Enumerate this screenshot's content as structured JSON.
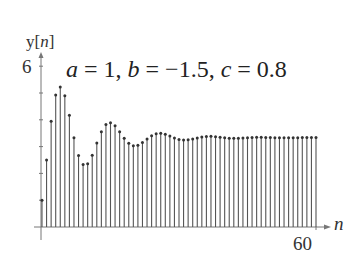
{
  "chart_data": {
    "type": "stem",
    "title_parts": {
      "a_label": "a",
      "a_value": "1",
      "b_label": "b",
      "b_value": "−1.5",
      "c_label": "c",
      "c_value": "0.8"
    },
    "xlabel": "n",
    "ylabel": "y[n]",
    "ylabel_parts": {
      "func": "y",
      "arg": "n"
    },
    "x_ticks": [
      "60"
    ],
    "y_ticks": [
      "6"
    ],
    "xlim": [
      0,
      60
    ],
    "ylim": [
      0,
      6
    ],
    "grid": false,
    "x": [
      0,
      1,
      2,
      3,
      4,
      5,
      6,
      7,
      8,
      9,
      10,
      11,
      12,
      13,
      14,
      15,
      16,
      17,
      18,
      19,
      20,
      21,
      22,
      23,
      24,
      25,
      26,
      27,
      28,
      29,
      30,
      31,
      32,
      33,
      34,
      35,
      36,
      37,
      38,
      39,
      40,
      41,
      42,
      43,
      44,
      45,
      46,
      47,
      48,
      49,
      50,
      51,
      52,
      53,
      54,
      55,
      56,
      57,
      58,
      59,
      60
    ],
    "values": [
      1.0,
      2.5,
      3.95,
      4.925,
      5.228,
      4.901,
      4.17,
      3.334,
      2.665,
      2.33,
      2.363,
      2.681,
      3.131,
      3.551,
      3.822,
      3.893,
      3.781,
      3.557,
      3.311,
      3.121,
      3.033,
      3.052,
      3.152,
      3.286,
      3.408,
      3.483,
      3.498,
      3.461,
      3.393,
      3.32,
      3.266,
      3.243,
      3.252,
      3.283,
      3.323,
      3.358,
      3.379,
      3.382,
      3.369,
      3.349,
      3.328,
      3.312,
      3.307,
      3.31,
      3.32,
      3.331,
      3.342,
      3.347,
      3.347,
      3.343,
      3.337,
      3.332,
      3.328,
      3.327,
      3.328,
      3.33,
      3.333,
      3.335,
      3.337,
      3.337,
      3.336
    ]
  },
  "colors": {
    "stem": "#555555",
    "marker": "#333333",
    "axis": "#777777",
    "text": "#222222"
  }
}
